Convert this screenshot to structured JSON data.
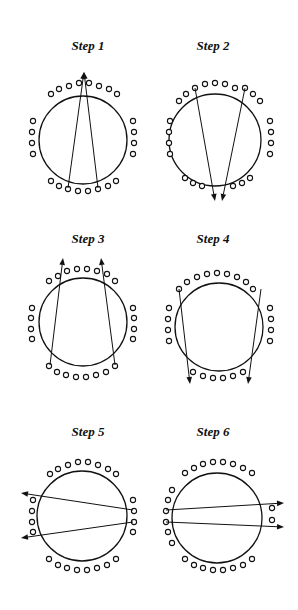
{
  "figure": {
    "title": "",
    "steps": [
      {
        "label": "Step 1",
        "label_pos": [
          88,
          50
        ],
        "circle": {
          "cx": 83,
          "cy": 140,
          "r": 44
        },
        "seats": {
          "top": [
            [
              51,
              94
            ],
            [
              59,
              89
            ],
            [
              69,
              86
            ],
            [
              79,
              83
            ],
            [
              89,
              83
            ],
            [
              99,
              86
            ],
            [
              109,
              89
            ],
            [
              117,
              94
            ]
          ],
          "left": [
            [
              33,
              121
            ],
            [
              32,
              132
            ],
            [
              32,
              143
            ],
            [
              33,
              154
            ]
          ],
          "right": [
            [
              133,
              121
            ],
            [
              134,
              132
            ],
            [
              134,
              143
            ],
            [
              133,
              154
            ]
          ],
          "bottom": [
            [
              51,
              181
            ],
            [
              59,
              186
            ],
            [
              68,
              189
            ],
            [
              78,
              191
            ],
            [
              88,
              191
            ],
            [
              98,
              189
            ],
            [
              108,
              186
            ],
            [
              116,
              181
            ]
          ]
        },
        "arrows": [
          {
            "from": [
              68,
              188
            ],
            "to": [
              84,
              72
            ]
          },
          {
            "from": [
              98,
              188
            ],
            "to": [
              84,
              72
            ]
          }
        ]
      },
      {
        "label": "Step 2",
        "label_pos": [
          213,
          50
        ],
        "circle": {
          "cx": 215,
          "cy": 140,
          "r": 46
        },
        "seats": {
          "top": [
            [
              179,
              101
            ],
            [
              186,
              94
            ],
            [
              195,
              88
            ],
            [
              205,
              84
            ],
            [
              215,
              83
            ],
            [
              225,
              84
            ],
            [
              235,
              88
            ],
            [
              245,
              88
            ],
            [
              253,
              94
            ],
            [
              260,
              101
            ]
          ],
          "left": [
            [
              170,
              121
            ],
            [
              169,
              132
            ],
            [
              169,
              143
            ],
            [
              170,
              154
            ]
          ],
          "right": [
            [
              270,
              121
            ],
            [
              271,
              132
            ],
            [
              271,
              143
            ],
            [
              270,
              154
            ]
          ],
          "bottom": [
            [
              185,
              178
            ],
            [
              193,
              183
            ],
            [
              202,
              186
            ],
            [
              233,
              186
            ],
            [
              242,
              183
            ],
            [
              250,
              178
            ]
          ]
        },
        "arrows": [
          {
            "from": [
              195,
              88
            ],
            "to": [
              215,
              201
            ]
          },
          {
            "from": [
              245,
              88
            ],
            "to": [
              222,
              201
            ]
          }
        ]
      },
      {
        "label": "Step 3",
        "label_pos": [
          88,
          243
        ],
        "circle": {
          "cx": 83,
          "cy": 322,
          "r": 44
        },
        "seats": {
          "top": [
            [
              49,
              281
            ],
            [
              58,
              276
            ],
            [
              67,
              271
            ],
            [
              77,
              269
            ],
            [
              87,
              269
            ],
            [
              97,
              271
            ],
            [
              107,
              274
            ],
            [
              115,
              281
            ]
          ],
          "left": [
            [
              32,
              308
            ],
            [
              31,
              318
            ],
            [
              31,
              329
            ],
            [
              32,
              339
            ]
          ],
          "right": [
            [
              133,
              308
            ],
            [
              134,
              318
            ],
            [
              134,
              329
            ],
            [
              133,
              339
            ]
          ],
          "bottom": [
            [
              49,
              366
            ],
            [
              57,
              372
            ],
            [
              66,
              375
            ],
            [
              76,
              377
            ],
            [
              86,
              377
            ],
            [
              96,
              375
            ],
            [
              106,
              372
            ],
            [
              115,
              366
            ]
          ]
        },
        "arrows": [
          {
            "from": [
              50,
              365
            ],
            "to": [
              63,
              258
            ]
          },
          {
            "from": [
              115,
              365
            ],
            "to": [
              101,
              258
            ]
          }
        ]
      },
      {
        "label": "Step 4",
        "label_pos": [
          213,
          243
        ],
        "circle": {
          "cx": 219,
          "cy": 327,
          "r": 44
        },
        "seats": {
          "top": [
            [
              179,
              289
            ],
            [
              187,
              282
            ],
            [
              197,
              277
            ],
            [
              207,
              274
            ],
            [
              217,
              273
            ],
            [
              227,
              274
            ],
            [
              237,
              277
            ],
            [
              246,
              282
            ],
            [
              253,
              289
            ]
          ],
          "left": [
            [
              169,
              308
            ],
            [
              168,
              319
            ],
            [
              168,
              330
            ],
            [
              169,
              341
            ]
          ],
          "right": [
            [
              270,
              308
            ],
            [
              271,
              319
            ],
            [
              271,
              330
            ],
            [
              270,
              341
            ]
          ],
          "bottom": [
            [
              193,
              372
            ],
            [
              203,
              376
            ],
            [
              213,
              378
            ],
            [
              223,
              378
            ],
            [
              233,
              376
            ],
            [
              243,
              372
            ]
          ]
        },
        "arrows": [
          {
            "from": [
              179,
              289
            ],
            "to": [
              190,
              384
            ]
          },
          {
            "from": [
              261,
              289
            ],
            "to": [
              248,
              384
            ]
          }
        ]
      },
      {
        "label": "Step 5",
        "label_pos": [
          88,
          436
        ],
        "circle": {
          "cx": 82,
          "cy": 516,
          "r": 45
        },
        "seats": {
          "top": [
            [
              50,
              474
            ],
            [
              58,
              469
            ],
            [
              68,
              465
            ],
            [
              78,
              462
            ],
            [
              88,
              462
            ],
            [
              98,
              465
            ],
            [
              108,
              469
            ],
            [
              116,
              474
            ]
          ],
          "left": [
            [
              33,
              500
            ],
            [
              32,
              511
            ],
            [
              32,
              522
            ],
            [
              33,
              532
            ]
          ],
          "right": [
            [
              133,
              500
            ],
            [
              134,
              511
            ],
            [
              134,
              522
            ],
            [
              133,
              532
            ]
          ],
          "bottom": [
            [
              49,
              559
            ],
            [
              58,
              565
            ],
            [
              67,
              568
            ],
            [
              77,
              570
            ],
            [
              87,
              570
            ],
            [
              97,
              568
            ],
            [
              107,
              565
            ],
            [
              116,
              559
            ]
          ]
        },
        "arrows": [
          {
            "from": [
              133,
              510
            ],
            "to": [
              21,
              493
            ]
          },
          {
            "from": [
              133,
              522
            ],
            "to": [
              21,
              538
            ]
          }
        ]
      },
      {
        "label": "Step 6",
        "label_pos": [
          213,
          436
        ],
        "circle": {
          "cx": 217,
          "cy": 518,
          "r": 45
        },
        "seats": {
          "top": [
            [
              185,
              473
            ],
            [
              194,
              468
            ],
            [
              203,
              464
            ],
            [
              213,
              462
            ],
            [
              223,
              462
            ],
            [
              233,
              464
            ],
            [
              243,
              468
            ],
            [
              252,
              473
            ]
          ],
          "left": [
            [
              172,
              490
            ],
            [
              168,
              500
            ],
            [
              166,
              511
            ],
            [
              166,
              522
            ],
            [
              168,
              532
            ],
            [
              172,
              543
            ]
          ],
          "right": [
            [
              272,
              508
            ],
            [
              272,
              520
            ]
          ],
          "bottom": [
            [
              185,
              559
            ],
            [
              194,
              565
            ],
            [
              203,
              568
            ],
            [
              213,
              570
            ],
            [
              223,
              570
            ],
            [
              233,
              568
            ],
            [
              243,
              565
            ],
            [
              252,
              559
            ]
          ]
        },
        "arrows": [
          {
            "from": [
              166,
              510
            ],
            "to": [
              284,
              503
            ]
          },
          {
            "from": [
              166,
              522
            ],
            "to": [
              284,
              527
            ]
          }
        ]
      }
    ]
  },
  "colors": {
    "ink": "#111111",
    "background": "#ffffff"
  }
}
